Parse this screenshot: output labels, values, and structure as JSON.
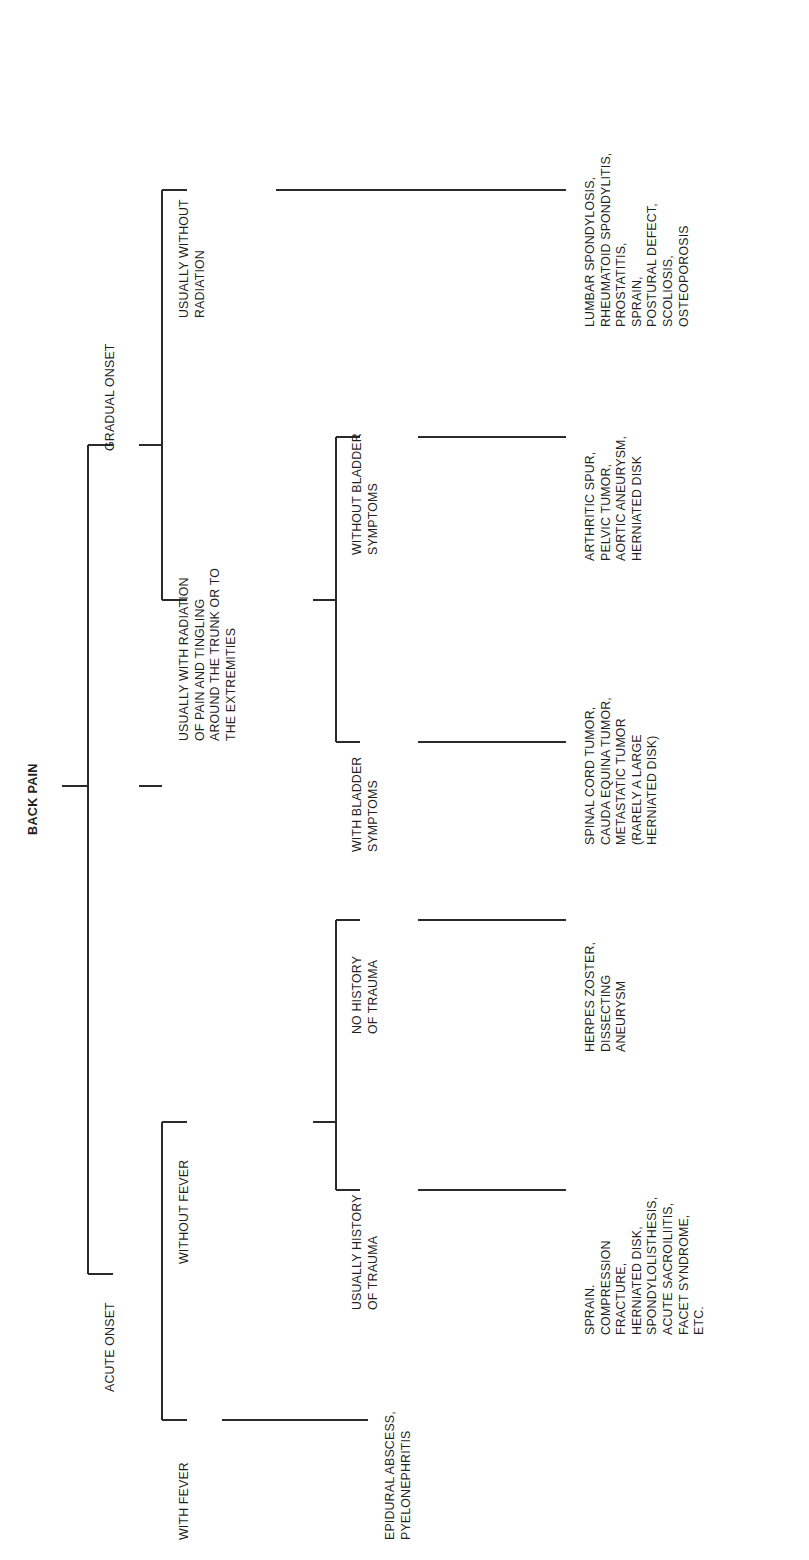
{
  "diagram": {
    "title": "BACK PAIN",
    "type": "decision-tree",
    "orientation": "rotated-90-counterclockwise",
    "root": {
      "label": "BACK PAIN"
    },
    "level1": [
      {
        "id": "acute",
        "label": "ACUTE ONSET"
      },
      {
        "id": "gradual",
        "label": "GRADUAL ONSET"
      }
    ],
    "level2": [
      {
        "id": "with-fever",
        "parent": "acute",
        "label": "WITH FEVER"
      },
      {
        "id": "without-fever",
        "parent": "acute",
        "label": "WITHOUT FEVER"
      },
      {
        "id": "with-radiation",
        "parent": "gradual",
        "label": "USUALLY WITH RADIATION\nOF PAIN AND TINGLING\nAROUND THE TRUNK OR TO\nTHE EXTREMITIES"
      },
      {
        "id": "without-radiation",
        "parent": "gradual",
        "label": "USUALLY WITHOUT\nRADIATION"
      }
    ],
    "level3": [
      {
        "id": "hx-trauma",
        "parent": "without-fever",
        "label": "USUALLY HISTORY\nOF TRAUMA"
      },
      {
        "id": "no-hx-trauma",
        "parent": "without-fever",
        "label": "NO HISTORY\nOF TRAUMA"
      },
      {
        "id": "with-bladder",
        "parent": "with-radiation",
        "label": "WITH BLADDER\nSYMPTOMS"
      },
      {
        "id": "without-bladder",
        "parent": "with-radiation",
        "label": "WITHOUT BLADDER\nSYMPTOMS"
      }
    ],
    "leaves": [
      {
        "id": "leaf-fever",
        "parent": "with-fever",
        "label": "EPIDURAL ABSCESS,\nPYELONEPHRITIS"
      },
      {
        "id": "leaf-trauma",
        "parent": "hx-trauma",
        "label": "SPRAIN.\nCOMPRESSION\nFRACTURE,\nHERNIATED DISK,\nSPONDYLOLISTHESIS,\nACUTE SACROILIITIS,\nFACET SYNDROME,\nETC."
      },
      {
        "id": "leaf-no-trauma",
        "parent": "no-hx-trauma",
        "label": "HERPES ZOSTER,\nDISSECTING\nANEURYSM"
      },
      {
        "id": "leaf-bladder",
        "parent": "with-bladder",
        "label": "SPINAL CORD TUMOR,\nCAUDA EQUINA TUMOR,\nMETASTATIC TUMOR\n(RARELY A LARGE\nHERNIATED DISK)"
      },
      {
        "id": "leaf-no-bladder",
        "parent": "without-bladder",
        "label": "ARTHRITIC SPUR,\nPELVIC TUMOR,\nAORTIC ANEURYSM,\nHERNIATED DISK"
      },
      {
        "id": "leaf-no-radiation",
        "parent": "without-radiation",
        "label": "LUMBAR SPONDYLOSIS,\nRHEUMATOID SPONDYLITIS,\nPROSTATITIS,\nSPRAIN,\nPOSTURAL DEFECT,\nSCOLIOSIS,\nOSTEOPOROSIS"
      }
    ],
    "colors": {
      "line": "#2a2a2a",
      "text": "#1f1f1f",
      "background": "#ffffff"
    }
  }
}
